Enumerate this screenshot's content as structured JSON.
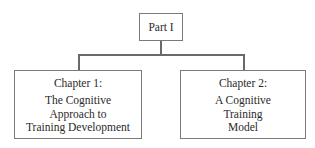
{
  "diagram": {
    "type": "hierarchy",
    "root": {
      "label": "Part I"
    },
    "children": [
      {
        "title": "Chapter 1:",
        "lines": [
          "The Cognitive",
          "Approach to",
          "Training Development"
        ]
      },
      {
        "title": "Chapter 2:",
        "lines": [
          "A Cognitive",
          "Training",
          "Model"
        ]
      }
    ],
    "colors": {
      "border": "#7a7a7a",
      "connector": "#6a6a6a",
      "text": "#2a2a2a",
      "background": "#ffffff"
    }
  }
}
